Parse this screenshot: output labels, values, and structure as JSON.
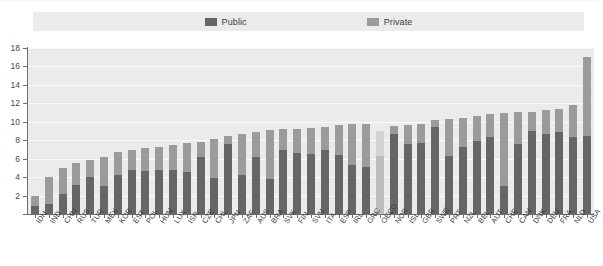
{
  "legend": {
    "items": [
      {
        "label": "Public",
        "color": "#666666",
        "icon": "legend-swatch-public"
      },
      {
        "label": "Private",
        "color": "#9b9b9b",
        "icon": "legend-swatch-private"
      }
    ]
  },
  "yaxis": {
    "ticks": [
      "0",
      "2",
      "4",
      "6",
      "8",
      "10",
      "12",
      "14",
      "16",
      "18"
    ]
  },
  "colors": {
    "public": "#666666",
    "private": "#9b9b9b",
    "highlight_public": "#bcbcbc",
    "highlight_private": "#d2d2d2",
    "plot_background": "#ebebeb",
    "legend_background": "#eceaea",
    "axis": "#6f6f6f"
  },
  "chart_data": {
    "type": "bar",
    "subtype": "stacked-bar",
    "title": "",
    "xlabel": "",
    "ylabel": "",
    "ylim": [
      0,
      18
    ],
    "ytick_step": 2,
    "grid": true,
    "legend_position": "top-center",
    "highlight_category": "OECD",
    "categories": [
      "IDN",
      "IND",
      "CHN",
      "RUS",
      "TUR",
      "MEX",
      "KOR",
      "EST",
      "POL",
      "HUN",
      "LUX",
      "ISR",
      "CZE",
      "CHL",
      "JPN",
      "ZAF",
      "AUS",
      "BRA",
      "SVK",
      "FIN",
      "SVN",
      "ITA",
      "ESP",
      "IRL",
      "GRC",
      "OECD",
      "NOR",
      "ISL",
      "GBR",
      "SWE",
      "PRT",
      "NZL",
      "BEL",
      "AUT",
      "CHE",
      "CAN",
      "DNK",
      "DEU",
      "FRA",
      "NLD",
      "USA"
    ],
    "series": [
      {
        "name": "Public",
        "values": [
          0.9,
          1.1,
          2.2,
          3.1,
          4.0,
          3.0,
          4.2,
          4.8,
          4.7,
          4.8,
          4.8,
          4.6,
          6.2,
          3.9,
          7.6,
          4.2,
          6.2,
          3.8,
          6.9,
          6.6,
          6.5,
          6.9,
          6.4,
          5.3,
          5.1,
          6.3,
          8.7,
          7.6,
          7.7,
          9.4,
          6.3,
          7.3,
          7.9,
          8.3,
          3.0,
          7.6,
          9.0,
          8.7,
          8.9,
          8.3,
          8.5
        ]
      },
      {
        "name": "Private",
        "values": [
          1.1,
          2.9,
          2.8,
          2.4,
          1.9,
          3.2,
          2.5,
          2.1,
          2.5,
          2.5,
          2.7,
          3.1,
          1.6,
          4.2,
          0.9,
          4.5,
          2.7,
          5.3,
          2.3,
          2.6,
          2.8,
          2.5,
          3.2,
          4.5,
          4.7,
          2.7,
          0.8,
          2.0,
          2.1,
          0.8,
          4.0,
          3.1,
          2.7,
          2.5,
          8.0,
          3.5,
          2.1,
          2.6,
          2.5,
          3.5,
          8.5
        ]
      }
    ],
    "totals": [
      2.0,
      4.0,
      5.0,
      5.5,
      5.9,
      6.2,
      6.7,
      6.9,
      7.2,
      7.3,
      7.5,
      7.7,
      7.8,
      8.1,
      8.5,
      8.7,
      8.9,
      9.1,
      9.2,
      9.2,
      9.3,
      9.4,
      9.6,
      9.8,
      9.8,
      9.0,
      9.5,
      9.6,
      9.8,
      10.2,
      10.3,
      10.4,
      10.6,
      10.8,
      11.0,
      11.1,
      11.1,
      11.3,
      11.4,
      11.8,
      17.0
    ]
  }
}
